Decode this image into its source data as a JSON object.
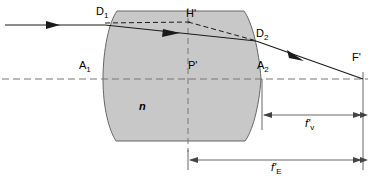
{
  "figure": {
    "type": "optical-ray-diagram",
    "background_color": "#ffffff",
    "line_color": "#1a1a1a",
    "glass_fill_color": "#c8c8c8",
    "glass_stroke_color": "#555555",
    "dash_color": "#666666"
  },
  "labels": {
    "d1": {
      "text": "D",
      "sub": "1",
      "prime": "",
      "x": 96,
      "y": 7
    },
    "h_prime": {
      "text": "H",
      "sub": "",
      "prime": "'",
      "x": 188,
      "y": 9
    },
    "d2": {
      "text": "D",
      "sub": "2",
      "prime": "",
      "x": 256,
      "y": 29
    },
    "f_prime": {
      "text": "F",
      "sub": "",
      "prime": "'",
      "x": 352,
      "y": 52
    },
    "a1": {
      "text": "A",
      "sub": "1",
      "prime": "",
      "x": 80,
      "y": 60
    },
    "p_prime": {
      "text": "P",
      "sub": "",
      "prime": "'",
      "x": 189,
      "y": 61
    },
    "a2": {
      "text": "A",
      "sub": "2",
      "prime": "",
      "x": 258,
      "y": 61
    },
    "n_index": {
      "text": "n",
      "sub": "",
      "prime": "",
      "x": 139,
      "y": 102
    }
  },
  "dimensions": {
    "f_v": {
      "symbol": "f",
      "prime": "'",
      "sub": "v",
      "label_x": 305,
      "label_y": 119,
      "line_y": 115,
      "x_start": 262,
      "x_end": 363
    },
    "f_e": {
      "symbol": "f",
      "prime": "'",
      "sub": "E",
      "label_x": 272,
      "label_y": 163,
      "line_y": 160,
      "x_start": 188,
      "x_end": 363
    }
  },
  "geometry": {
    "optical_axis_y": 79,
    "lens": {
      "left_vertex_x": 103,
      "right_vertex_x": 261,
      "top_y": 11,
      "bottom_y": 141,
      "top_left_x": 117,
      "top_right_x": 244,
      "bottom_left_x": 116,
      "bottom_right_x": 245
    },
    "principal_plane_x": 188,
    "focal_point_x": 363,
    "incoming_ray_y": 25,
    "d1_point": {
      "x": 105,
      "y": 25
    },
    "h_point": {
      "x": 188,
      "y": 22
    },
    "d2_point": {
      "x": 256,
      "y": 41
    },
    "f_point": {
      "x": 363,
      "y": 79
    }
  }
}
